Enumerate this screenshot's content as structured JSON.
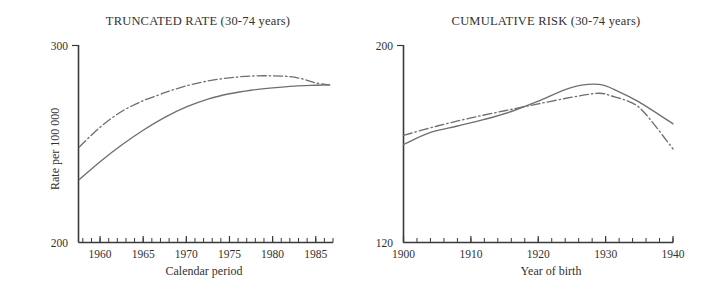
{
  "figure": {
    "background_color": "#ffffff",
    "line_color": "#6d6f72",
    "axis_color": "#3a3a3a"
  },
  "panels": {
    "left": {
      "title": "TRUNCATED RATE (30-74 years)",
      "xlabel": "Calendar period",
      "ylabel": "Rate per 100 000",
      "ymin_label": "200",
      "ymax_label": "300"
    },
    "right": {
      "title": "CUMULATIVE RISK (30-74 years)",
      "xlabel": "Year of birth",
      "ylabel": "Risk per 1000",
      "ymin_label": "120",
      "ymax_label": "200"
    }
  },
  "chart_data": [
    {
      "type": "line",
      "title": "TRUNCATED RATE (30-74 years)",
      "xlabel": "Calendar period",
      "ylabel": "Rate per 100 000",
      "xlim": [
        1957.5,
        1987.0
      ],
      "ylim": [
        200,
        300
      ],
      "xticks": [
        1960,
        1965,
        1970,
        1975,
        1980,
        1985
      ],
      "xtick_labels": [
        "1960",
        "1965",
        "1970",
        "1975",
        "1980",
        "1985"
      ],
      "yticks": [
        200,
        300
      ],
      "ytick_labels": [
        "200",
        "300"
      ],
      "minor_xtick_step": 1,
      "grid": false,
      "legend": null,
      "series": [
        {
          "name": "dash-dot series",
          "style": "dashdot",
          "x": [
            1957.6,
            1960.0,
            1962.5,
            1965.0,
            1967.0,
            1967.4,
            1970.0,
            1972.5,
            1975.0,
            1977.5,
            1980.0,
            1982.0,
            1983.5,
            1985.0,
            1986.6
          ],
          "y": [
            248.5,
            258.5,
            266.5,
            272.0,
            275.2,
            276.0,
            279.5,
            282.0,
            283.6,
            284.5,
            284.6,
            284.2,
            283.0,
            281.0,
            280.0
          ]
        },
        {
          "name": "solid series",
          "style": "solid",
          "x": [
            1957.6,
            1960.0,
            1962.5,
            1965.0,
            1967.5,
            1970.0,
            1972.5,
            1975.0,
            1977.5,
            1980.0,
            1982.5,
            1985.0,
            1986.6
          ],
          "y": [
            232.0,
            241.0,
            249.5,
            257.0,
            263.5,
            268.8,
            272.8,
            275.5,
            277.3,
            278.5,
            279.4,
            279.8,
            280.0
          ]
        }
      ]
    },
    {
      "type": "line",
      "title": "CUMULATIVE RISK (30-74 years)",
      "xlabel": "Year of birth",
      "ylabel": "Risk per 1000",
      "xlim": [
        1900,
        1940
      ],
      "ylim": [
        120,
        200
      ],
      "xticks": [
        1900,
        1910,
        1920,
        1930,
        1940
      ],
      "xtick_labels": [
        "1900",
        "1910",
        "1920",
        "1930",
        "1940"
      ],
      "yticks": [
        120,
        200
      ],
      "ytick_labels": [
        "120",
        "200"
      ],
      "minor_xtick_step": 2,
      "grid": false,
      "legend": null,
      "series": [
        {
          "name": "dash-dot series",
          "style": "dashdot",
          "x": [
            1900,
            1905,
            1910,
            1915,
            1920,
            1925,
            1929,
            1931,
            1934,
            1936,
            1940
          ],
          "y": [
            163.5,
            167.3,
            170.6,
            173.5,
            176.3,
            179.0,
            180.6,
            179.4,
            176.6,
            172.0,
            158.0
          ]
        },
        {
          "name": "solid series",
          "style": "solid",
          "x": [
            1900,
            1904,
            1908,
            1912,
            1916,
            1920,
            1925,
            1929,
            1932,
            1935,
            1940
          ],
          "y": [
            159.8,
            164.7,
            167.3,
            170.0,
            173.2,
            177.4,
            183.0,
            184.2,
            181.2,
            177.0,
            168.2
          ]
        }
      ]
    }
  ]
}
